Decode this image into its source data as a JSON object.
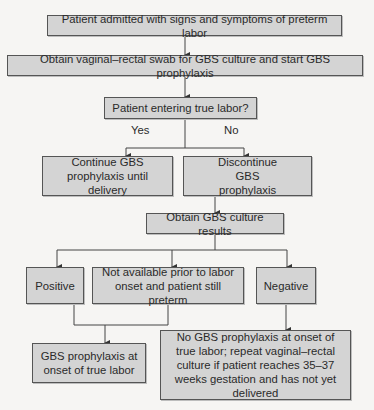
{
  "flowchart": {
    "nodes": {
      "admitted": "Patient admitted with signs and symptoms of preterm labor",
      "obtain_swab": "Obtain vaginal–rectal swab for GBS culture and start GBS prophylaxis",
      "true_labor_question": "Patient entering true labor?",
      "continue_prophylaxis": "Continue GBS prophylaxis until delivery",
      "discontinue_prophylaxis": "Discontinue GBS prophylaxis",
      "obtain_results": "Obtain GBS culture results",
      "positive": "Positive",
      "not_available": "Not available prior to labor onset and patient still preterm",
      "negative": "Negative",
      "prophylaxis_at_onset": "GBS prophylaxis at onset of true labor",
      "no_prophylaxis": "No GBS prophylaxis at onset of true labor; repeat vaginal–rectal culture if patient reaches 35–37 weeks gestation and has not yet delivered"
    },
    "edge_labels": {
      "yes": "Yes",
      "no": "No"
    },
    "colors": {
      "box_fill": "#d4d4d4",
      "box_border": "#555555",
      "line": "#444444",
      "background": "#f6f5f3"
    }
  }
}
